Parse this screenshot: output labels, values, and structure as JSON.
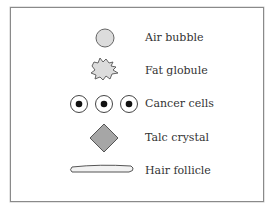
{
  "legend": {
    "items": [
      {
        "label": "Air bubble",
        "icon": "air-bubble-icon"
      },
      {
        "label": "Fat globule",
        "icon": "fat-globule-icon"
      },
      {
        "label": "Cancer cells",
        "icon": "cancer-cells-icon"
      },
      {
        "label": "Talc crystal",
        "icon": "talc-crystal-icon"
      },
      {
        "label": "Hair follicle",
        "icon": "hair-follicle-icon"
      }
    ]
  },
  "colors": {
    "light_fill": "#dcdcdc",
    "dark_fill": "#a6a6a6",
    "stroke": "#555555",
    "nucleus": "#111111"
  }
}
